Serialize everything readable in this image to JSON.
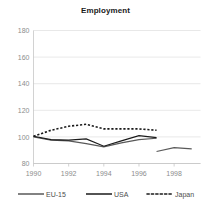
{
  "chart_data": {
    "type": "line",
    "title": "Employment",
    "xlabel": "",
    "ylabel": "",
    "xlim": [
      1990,
      1999.5
    ],
    "ylim": [
      80,
      180
    ],
    "xticks": [
      1990,
      1992,
      1994,
      1996,
      1998
    ],
    "yticks": [
      80,
      100,
      120,
      140,
      160,
      180
    ],
    "grid": true,
    "legend_position": "bottom",
    "series": [
      {
        "name": "EU-15",
        "color": "#595959",
        "style": "solid",
        "x": [
          1990,
          1991,
          1992,
          1993,
          1994,
          1995,
          1996,
          1997
        ],
        "values": [
          100,
          97.5,
          97,
          95,
          92.5,
          95.5,
          98,
          99
        ]
      },
      {
        "name": "EU-15-segment2",
        "color": "#595959",
        "style": "solid",
        "x": [
          1997,
          1998,
          1999
        ],
        "values": [
          89,
          92,
          91
        ]
      },
      {
        "name": "USA",
        "color": "#1a1a1a",
        "style": "solid",
        "x": [
          1990,
          1991,
          1992,
          1993,
          1994,
          1995,
          1996,
          1997
        ],
        "values": [
          100.5,
          98,
          97.5,
          98.5,
          93,
          97,
          101,
          99.5
        ]
      },
      {
        "name": "Japan",
        "color": "#1a1a1a",
        "style": "dotted",
        "x": [
          1990,
          1991,
          1992,
          1993,
          1994,
          1995,
          1996,
          1997
        ],
        "values": [
          100.5,
          105,
          108,
          109.5,
          106,
          106,
          106,
          105
        ]
      }
    ]
  },
  "legend": {
    "items": [
      {
        "label": "EU-15",
        "color": "#595959",
        "style": "solid"
      },
      {
        "label": "USA",
        "color": "#1a1a1a",
        "style": "solid"
      },
      {
        "label": "Japan",
        "color": "#1a1a1a",
        "style": "dotted"
      }
    ]
  },
  "axes": {
    "y_labels": [
      "180",
      "160",
      "140",
      "120",
      "100",
      "80"
    ],
    "x_labels": [
      "1990",
      "1992",
      "1994",
      "1996",
      "1998"
    ]
  },
  "colors": {
    "grid": "#d9d9d9",
    "axis": "#bfbfbf",
    "tick_text": "#8c8c8c",
    "title_text": "#1a1a1a",
    "legend_text": "#4d4d4d",
    "background": "#ffffff"
  }
}
